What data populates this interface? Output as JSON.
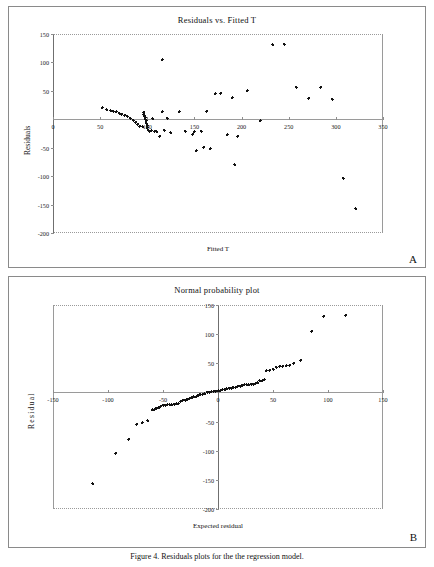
{
  "figure": {
    "caption": "Figure 4. Residuals plots for the the regression model."
  },
  "panels": [
    {
      "letter": "A",
      "title": "Residuals vs. Fitted T",
      "xlabel": "Fitted T",
      "ylabel": "Residuals"
    },
    {
      "letter": "B",
      "title": "Normal probability plot",
      "xlabel": "Expected residual",
      "ylabel": "R e s i d u a l"
    }
  ],
  "chart_data": [
    {
      "type": "scatter",
      "panel": "A",
      "title": "Residuals vs. Fitted T",
      "xlabel": "Fitted T",
      "ylabel": "Residuals",
      "xlim": [
        0,
        350
      ],
      "ylim": [
        -200,
        150
      ],
      "xticks": [
        0,
        50,
        100,
        150,
        200,
        250,
        300,
        350
      ],
      "yticks": [
        -200,
        -150,
        -100,
        -50,
        0,
        50,
        100,
        150
      ],
      "grid": false,
      "legend": null,
      "marker": "filled-diamond",
      "marker_color": "#111111",
      "points": [
        [
          52,
          20
        ],
        [
          57,
          17
        ],
        [
          61,
          15
        ],
        [
          64,
          14
        ],
        [
          67,
          13
        ],
        [
          70,
          11
        ],
        [
          73,
          9
        ],
        [
          76,
          7
        ],
        [
          79,
          5
        ],
        [
          82,
          2
        ],
        [
          85,
          -2
        ],
        [
          88,
          -5
        ],
        [
          90,
          -9
        ],
        [
          92,
          -12
        ],
        [
          95,
          -13
        ],
        [
          96,
          12
        ],
        [
          96,
          9
        ],
        [
          97,
          6
        ],
        [
          98,
          3
        ],
        [
          98,
          0
        ],
        [
          99,
          -3
        ],
        [
          99,
          -7
        ],
        [
          100,
          -11
        ],
        [
          100,
          -15
        ],
        [
          101,
          -19
        ],
        [
          102,
          -21
        ],
        [
          104,
          -20
        ],
        [
          106,
          1
        ],
        [
          108,
          -21
        ],
        [
          110,
          -22
        ],
        [
          113,
          -30
        ],
        [
          116,
          13
        ],
        [
          118,
          -19
        ],
        [
          121,
          2
        ],
        [
          125,
          -24
        ],
        [
          134,
          13
        ],
        [
          140,
          -21
        ],
        [
          148,
          -26
        ],
        [
          150,
          -22
        ],
        [
          152,
          -55
        ],
        [
          157,
          -21
        ],
        [
          160,
          -49
        ],
        [
          163,
          14
        ],
        [
          167,
          -52
        ],
        [
          172,
          45
        ],
        [
          178,
          46
        ],
        [
          185,
          -27
        ],
        [
          190,
          38
        ],
        [
          193,
          -80
        ],
        [
          196,
          -30
        ],
        [
          206,
          50
        ],
        [
          220,
          -3
        ],
        [
          233,
          131
        ],
        [
          245,
          132
        ],
        [
          258,
          56
        ],
        [
          271,
          37
        ],
        [
          284,
          56
        ],
        [
          296,
          35
        ],
        [
          308,
          -104
        ],
        [
          321,
          -157
        ],
        [
          116,
          105
        ]
      ]
    },
    {
      "type": "scatter",
      "panel": "B",
      "title": "Normal probability plot",
      "xlabel": "Expected residual",
      "ylabel": "Residual",
      "xlim": [
        -150,
        150
      ],
      "ylim": [
        -200,
        150
      ],
      "xticks": [
        -150,
        -100,
        -50,
        0,
        50,
        100,
        150
      ],
      "yticks": [
        -200,
        -150,
        -100,
        -50,
        0,
        50,
        100,
        150
      ],
      "grid": false,
      "legend": null,
      "marker": "filled-diamond",
      "marker_color": "#111111",
      "points": [
        [
          -114,
          -157
        ],
        [
          -93,
          -104
        ],
        [
          -81,
          -80
        ],
        [
          -74,
          -55
        ],
        [
          -69,
          -52
        ],
        [
          -64,
          -49
        ],
        [
          -60,
          -30
        ],
        [
          -58,
          -30
        ],
        [
          -56,
          -27
        ],
        [
          -54,
          -26
        ],
        [
          -52,
          -24
        ],
        [
          -50,
          -22
        ],
        [
          -48,
          -22
        ],
        [
          -46,
          -21
        ],
        [
          -44,
          -21
        ],
        [
          -42,
          -21
        ],
        [
          -40,
          -20
        ],
        [
          -38,
          -19
        ],
        [
          -36,
          -19
        ],
        [
          -34,
          -15
        ],
        [
          -32,
          -13
        ],
        [
          -30,
          -13
        ],
        [
          -28,
          -12
        ],
        [
          -26,
          -11
        ],
        [
          -24,
          -9
        ],
        [
          -22,
          -7
        ],
        [
          -20,
          -7
        ],
        [
          -18,
          -5
        ],
        [
          -16,
          -3
        ],
        [
          -14,
          -3
        ],
        [
          -12,
          -2
        ],
        [
          -10,
          0
        ],
        [
          -8,
          0
        ],
        [
          -6,
          1
        ],
        [
          -4,
          2
        ],
        [
          -2,
          2
        ],
        [
          0,
          3
        ],
        [
          2,
          3
        ],
        [
          4,
          5
        ],
        [
          6,
          5
        ],
        [
          8,
          6
        ],
        [
          10,
          7
        ],
        [
          12,
          7
        ],
        [
          14,
          9
        ],
        [
          16,
          9
        ],
        [
          18,
          11
        ],
        [
          20,
          11
        ],
        [
          22,
          12
        ],
        [
          24,
          13
        ],
        [
          26,
          13
        ],
        [
          28,
          13
        ],
        [
          30,
          14
        ],
        [
          32,
          14
        ],
        [
          34,
          15
        ],
        [
          36,
          17
        ],
        [
          38,
          20
        ],
        [
          40,
          20
        ],
        [
          42,
          22
        ],
        [
          44,
          37
        ],
        [
          47,
          38
        ],
        [
          50,
          40
        ],
        [
          53,
          43
        ],
        [
          56,
          45
        ],
        [
          59,
          45
        ],
        [
          62,
          46
        ],
        [
          65,
          47
        ],
        [
          69,
          50
        ],
        [
          75,
          55
        ],
        [
          85,
          105
        ],
        [
          96,
          131
        ],
        [
          116,
          132
        ]
      ]
    }
  ]
}
